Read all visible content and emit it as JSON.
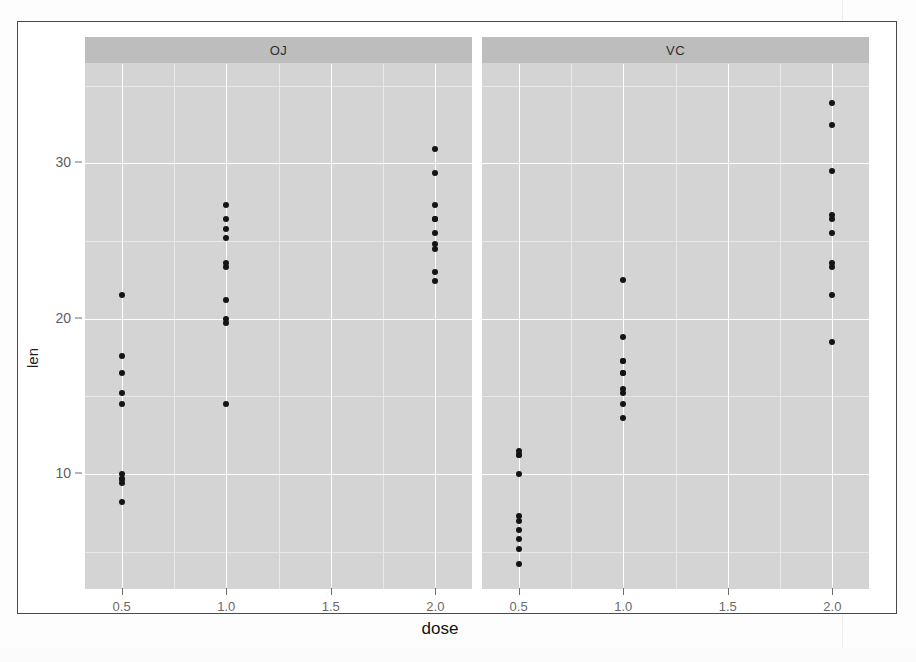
{
  "figure": {
    "x_title": "dose",
    "y_title": "len",
    "strip_oj": "OJ",
    "strip_vc": "VC"
  },
  "axes": {
    "y_ticks": [
      {
        "value": 10,
        "label": "10"
      },
      {
        "value": 20,
        "label": "20"
      },
      {
        "value": 30,
        "label": "30"
      }
    ],
    "x_ticks": [
      {
        "value": 0.5,
        "label": "0.5"
      },
      {
        "value": 1.0,
        "label": "1.0"
      },
      {
        "value": 1.5,
        "label": "1.5"
      },
      {
        "value": 2.0,
        "label": "2.0"
      }
    ],
    "y_minor": [
      5,
      15,
      25,
      35
    ],
    "x_minor": [
      0.75,
      1.25,
      1.75
    ],
    "xlim": [
      0.325,
      2.175
    ],
    "ylim": [
      2.6,
      36.4
    ],
    "grid": true
  },
  "colors": {
    "panel_fill": "#d4d4d4",
    "strip_fill": "#bdbdbd",
    "major_grid": "#ffffff",
    "minor_grid": "#e8e8e8",
    "point": "#141414",
    "frame": "#4a4a4a",
    "tick_text": "#6a6a6a",
    "title_text": "#131313"
  },
  "chart_data": {
    "type": "scatter",
    "title": "",
    "subtitle": "",
    "xlabel": "dose",
    "ylabel": "len",
    "xlim": [
      0.325,
      2.175
    ],
    "ylim": [
      2.6,
      36.4
    ],
    "grid": true,
    "legend": "none",
    "facet_by": "supp",
    "facets": [
      "OJ",
      "VC"
    ],
    "x_tick_labels": [
      "0.5",
      "1.0",
      "1.5",
      "2.0"
    ],
    "y_tick_labels": [
      "10",
      "20",
      "30"
    ],
    "series": [
      {
        "name": "OJ",
        "facet": "OJ",
        "x": [
          0.5,
          0.5,
          0.5,
          0.5,
          0.5,
          0.5,
          0.5,
          0.5,
          0.5,
          0.5,
          1.0,
          1.0,
          1.0,
          1.0,
          1.0,
          1.0,
          1.0,
          1.0,
          1.0,
          1.0,
          2.0,
          2.0,
          2.0,
          2.0,
          2.0,
          2.0,
          2.0,
          2.0,
          2.0,
          2.0
        ],
        "y": [
          15.2,
          21.5,
          17.6,
          9.7,
          14.5,
          10.0,
          8.2,
          9.4,
          16.5,
          9.7,
          19.7,
          23.3,
          23.6,
          26.4,
          20.0,
          25.2,
          25.8,
          21.2,
          14.5,
          27.3,
          25.5,
          26.4,
          22.4,
          24.5,
          24.8,
          30.9,
          26.4,
          27.3,
          29.4,
          23.0
        ],
        "color": "#141414",
        "marker": "circle"
      },
      {
        "name": "VC",
        "facet": "VC",
        "x": [
          0.5,
          0.5,
          0.5,
          0.5,
          0.5,
          0.5,
          0.5,
          0.5,
          0.5,
          0.5,
          1.0,
          1.0,
          1.0,
          1.0,
          1.0,
          1.0,
          1.0,
          1.0,
          1.0,
          1.0,
          2.0,
          2.0,
          2.0,
          2.0,
          2.0,
          2.0,
          2.0,
          2.0,
          2.0,
          2.0
        ],
        "y": [
          4.2,
          11.5,
          7.3,
          5.8,
          6.4,
          10.0,
          11.2,
          11.2,
          5.2,
          7.0,
          16.5,
          16.5,
          15.2,
          17.3,
          22.5,
          17.3,
          13.6,
          14.5,
          18.8,
          15.5,
          23.6,
          18.5,
          33.9,
          25.5,
          26.4,
          32.5,
          26.7,
          21.5,
          23.3,
          29.5
        ],
        "color": "#141414",
        "marker": "circle"
      }
    ]
  }
}
